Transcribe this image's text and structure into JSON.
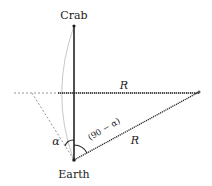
{
  "diagram": {
    "labels": {
      "top": "Crab",
      "bottom": "Earth",
      "radius_top": "R",
      "radius_bottom": "R",
      "angle_left": "α",
      "angle_right": "(90 − α)"
    },
    "colors": {
      "line": "#222222",
      "arc": "#c8c8c8",
      "dashed": "#555555"
    }
  }
}
